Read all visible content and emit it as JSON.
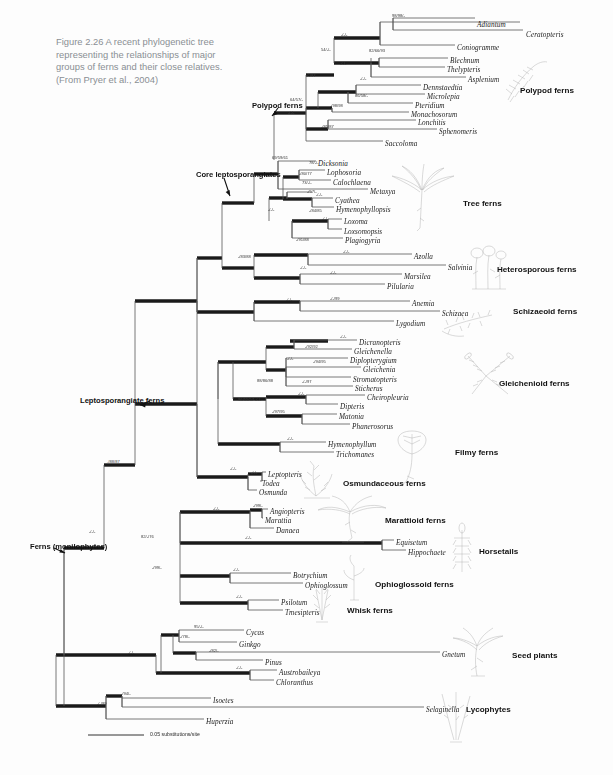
{
  "figure": {
    "caption": "Figure 2.26  A recent phylogenetic tree representing the relationships of major groups of ferns and their close relatives. (From Pryer et al., 2004)",
    "scale_bar_label": "0.05 substitutions/site"
  },
  "clade_labels": [
    {
      "text": "Polypod ferns",
      "x": 252,
      "y": 101
    },
    {
      "text": "Core leptosporangiates",
      "x": 196,
      "y": 170
    },
    {
      "text": "Leptosporangiate ferns",
      "x": 80,
      "y": 396
    },
    {
      "text": "Ferns (monilophytes)",
      "x": 30,
      "y": 542
    }
  ],
  "group_labels": [
    {
      "text": "Polypod ferns",
      "x": 520,
      "y": 86
    },
    {
      "text": "Tree ferns",
      "x": 463,
      "y": 199
    },
    {
      "text": "Heterosporous ferns",
      "x": 497,
      "y": 265
    },
    {
      "text": "Schizaeoid ferns",
      "x": 513,
      "y": 307
    },
    {
      "text": "Gleichenioid ferns",
      "x": 499,
      "y": 379
    },
    {
      "text": "Filmy ferns",
      "x": 455,
      "y": 448
    },
    {
      "text": "Osmundaceous ferns",
      "x": 343,
      "y": 479
    },
    {
      "text": "Marattioid ferns",
      "x": 385,
      "y": 516
    },
    {
      "text": "Horsetails",
      "x": 479,
      "y": 547
    },
    {
      "text": "Ophioglossoid ferns",
      "x": 375,
      "y": 580
    },
    {
      "text": "Whisk ferns",
      "x": 347,
      "y": 606
    },
    {
      "text": "Seed plants",
      "x": 512,
      "y": 651
    },
    {
      "text": "Lycophytes",
      "x": 466,
      "y": 705
    }
  ],
  "taxa": [
    {
      "name": "Adiantum",
      "x": 477,
      "y": 21,
      "italic": true
    },
    {
      "name": "Ceratopteris",
      "x": 526,
      "y": 31,
      "italic": true
    },
    {
      "name": "Coniogramme",
      "x": 457,
      "y": 44,
      "italic": true
    },
    {
      "name": "Blechnum",
      "x": 450,
      "y": 57,
      "italic": true
    },
    {
      "name": "Thelypteris",
      "x": 447,
      "y": 66,
      "italic": true
    },
    {
      "name": "Asplenium",
      "x": 468,
      "y": 76,
      "italic": true
    },
    {
      "name": "Dennstaedtia",
      "x": 423,
      "y": 84,
      "italic": true
    },
    {
      "name": "Microlepia",
      "x": 427,
      "y": 93,
      "italic": true
    },
    {
      "name": "Pteridium",
      "x": 415,
      "y": 102,
      "italic": true
    },
    {
      "name": "Monachosorum",
      "x": 411,
      "y": 111,
      "italic": true
    },
    {
      "name": "Lonchitis",
      "x": 418,
      "y": 119,
      "italic": true
    },
    {
      "name": "Sphenomeris",
      "x": 439,
      "y": 128,
      "italic": true
    },
    {
      "name": "Saccoloma",
      "x": 385,
      "y": 140,
      "italic": true
    },
    {
      "name": "Dicksonia",
      "x": 318,
      "y": 160,
      "italic": true
    },
    {
      "name": "Lophosoria",
      "x": 327,
      "y": 169,
      "italic": true
    },
    {
      "name": "Calochlaena",
      "x": 333,
      "y": 179,
      "italic": true
    },
    {
      "name": "Metaxya",
      "x": 370,
      "y": 188,
      "italic": true
    },
    {
      "name": "Cyathea",
      "x": 335,
      "y": 197,
      "italic": true
    },
    {
      "name": "Hymenophyllopsis",
      "x": 336,
      "y": 206,
      "italic": true
    },
    {
      "name": "Loxoma",
      "x": 344,
      "y": 218,
      "italic": true
    },
    {
      "name": "Loxsomopsis",
      "x": 344,
      "y": 228,
      "italic": true
    },
    {
      "name": "Plagiogyria",
      "x": 345,
      "y": 237,
      "italic": true
    },
    {
      "name": "Azolla",
      "x": 414,
      "y": 253,
      "italic": true
    },
    {
      "name": "Salvinia",
      "x": 448,
      "y": 264,
      "italic": true
    },
    {
      "name": "Marsilea",
      "x": 404,
      "y": 273,
      "italic": true
    },
    {
      "name": "Pilularia",
      "x": 387,
      "y": 283,
      "italic": true
    },
    {
      "name": "Anemia",
      "x": 412,
      "y": 300,
      "italic": true
    },
    {
      "name": "Schizaea",
      "x": 442,
      "y": 310,
      "italic": true
    },
    {
      "name": "Lygodium",
      "x": 396,
      "y": 320,
      "italic": true
    },
    {
      "name": "Dicranopteris",
      "x": 359,
      "y": 339,
      "italic": true
    },
    {
      "name": "Gleichenella",
      "x": 354,
      "y": 348,
      "italic": true
    },
    {
      "name": "Diplopterygium",
      "x": 350,
      "y": 357,
      "italic": true
    },
    {
      "name": "Gleichenia",
      "x": 363,
      "y": 366,
      "italic": true
    },
    {
      "name": "Stromatopteris",
      "x": 353,
      "y": 376,
      "italic": true
    },
    {
      "name": "Sticherus",
      "x": 355,
      "y": 385,
      "italic": true
    },
    {
      "name": "Cheiropleuria",
      "x": 367,
      "y": 394,
      "italic": true
    },
    {
      "name": "Dipteris",
      "x": 340,
      "y": 403,
      "italic": true
    },
    {
      "name": "Matonia",
      "x": 339,
      "y": 413,
      "italic": true
    },
    {
      "name": "Phanerosorus",
      "x": 352,
      "y": 423,
      "italic": true
    },
    {
      "name": "Hymenophyllum",
      "x": 328,
      "y": 441,
      "italic": true
    },
    {
      "name": "Trichomanes",
      "x": 336,
      "y": 451,
      "italic": true
    },
    {
      "name": "Leptopteris",
      "x": 268,
      "y": 471,
      "italic": true
    },
    {
      "name": "Todea",
      "x": 262,
      "y": 480,
      "italic": true
    },
    {
      "name": "Osmunda",
      "x": 259,
      "y": 489,
      "italic": true
    },
    {
      "name": "Angiopteris",
      "x": 270,
      "y": 508,
      "italic": true
    },
    {
      "name": "Marattia",
      "x": 265,
      "y": 517,
      "italic": true
    },
    {
      "name": "Danaea",
      "x": 276,
      "y": 527,
      "italic": true
    },
    {
      "name": "Equisetum",
      "x": 396,
      "y": 539,
      "italic": true
    },
    {
      "name": "Hippochaete",
      "x": 408,
      "y": 549,
      "italic": true
    },
    {
      "name": "Botrychium",
      "x": 293,
      "y": 572,
      "italic": true
    },
    {
      "name": "Ophioglossum",
      "x": 305,
      "y": 582,
      "italic": true
    },
    {
      "name": "Psilotum",
      "x": 281,
      "y": 599,
      "italic": true
    },
    {
      "name": "Tmesipteris",
      "x": 285,
      "y": 609,
      "italic": true
    },
    {
      "name": "Cycas",
      "x": 246,
      "y": 629,
      "italic": true
    },
    {
      "name": "Ginkgo",
      "x": 239,
      "y": 641,
      "italic": true
    },
    {
      "name": "Gnetum",
      "x": 442,
      "y": 651,
      "italic": true
    },
    {
      "name": "Pinus",
      "x": 265,
      "y": 659,
      "italic": true
    },
    {
      "name": "Austrobaileya",
      "x": 279,
      "y": 669,
      "italic": true
    },
    {
      "name": "Chloranthus",
      "x": 276,
      "y": 679,
      "italic": true
    },
    {
      "name": "Isoetes",
      "x": 213,
      "y": 697,
      "italic": true
    },
    {
      "name": "Selaginella",
      "x": 426,
      "y": 706,
      "italic": true
    },
    {
      "name": "Huperzia",
      "x": 206,
      "y": 718,
      "italic": true
    }
  ],
  "support_values": [
    {
      "text": "98/98/-",
      "x": 392,
      "y": 13
    },
    {
      "text": "-/-/-",
      "x": 341,
      "y": 32
    },
    {
      "text": "54/-/-",
      "x": 321,
      "y": 47
    },
    {
      "text": "82/66/93",
      "x": 369,
      "y": 48
    },
    {
      "text": "-/-/-",
      "x": 340,
      "y": 61
    },
    {
      "text": "-/-/97",
      "x": 306,
      "y": 73
    },
    {
      "text": "-/-/-",
      "x": 360,
      "y": 76
    },
    {
      "text": "86/58/-",
      "x": 355,
      "y": 93
    },
    {
      "text": "64/57/-",
      "x": 290,
      "y": 97
    },
    {
      "text": "-/98/98",
      "x": 330,
      "y": 103
    },
    {
      "text": "-/-/-",
      "x": 288,
      "y": 110
    },
    {
      "text": "-/85/87",
      "x": 321,
      "y": 124
    },
    {
      "text": "69/59/61",
      "x": 272,
      "y": 155
    },
    {
      "text": "78/-/-",
      "x": 309,
      "y": 160
    },
    {
      "text": "-/80/77",
      "x": 299,
      "y": 171
    },
    {
      "text": "73/-/-",
      "x": 302,
      "y": 180
    },
    {
      "text": "-/57/-",
      "x": 307,
      "y": 189
    },
    {
      "text": "-/-/-",
      "x": 316,
      "y": 192
    },
    {
      "text": "-/-/-",
      "x": 268,
      "y": 207
    },
    {
      "text": "-/84/85",
      "x": 309,
      "y": 208
    },
    {
      "text": "-/-/-",
      "x": 322,
      "y": 216
    },
    {
      "text": "-/91/88",
      "x": 296,
      "y": 237
    },
    {
      "text": "-/83/88",
      "x": 238,
      "y": 254
    },
    {
      "text": "-/-/-",
      "x": 343,
      "y": 249
    },
    {
      "text": "-/-/-",
      "x": 300,
      "y": 265
    },
    {
      "text": "-/-/-",
      "x": 330,
      "y": 270
    },
    {
      "text": "-/-/-",
      "x": 286,
      "y": 297
    },
    {
      "text": "-/-/99",
      "x": 330,
      "y": 296
    },
    {
      "text": "-/-/-",
      "x": 340,
      "y": 334
    },
    {
      "text": "-/92/92",
      "x": 305,
      "y": 344
    },
    {
      "text": "-/-/-",
      "x": 287,
      "y": 356
    },
    {
      "text": "-/94/95",
      "x": 313,
      "y": 359
    },
    {
      "text": "88/86/88",
      "x": 257,
      "y": 378
    },
    {
      "text": "-/-/97",
      "x": 302,
      "y": 379
    },
    {
      "text": "-/-/-",
      "x": 298,
      "y": 391
    },
    {
      "text": "-/97/95",
      "x": 272,
      "y": 409
    },
    {
      "text": "96/55/57",
      "x": 238,
      "y": 397
    },
    {
      "text": "-/-/-",
      "x": 255,
      "y": 397
    },
    {
      "text": "-/-/-",
      "x": 287,
      "y": 436
    },
    {
      "text": "-/-/-",
      "x": 251,
      "y": 470
    },
    {
      "text": "-/-/-",
      "x": 230,
      "y": 466
    },
    {
      "text": "-/88/87",
      "x": 107,
      "y": 459
    },
    {
      "text": "-/99/-",
      "x": 253,
      "y": 503
    },
    {
      "text": "-/-/-",
      "x": 213,
      "y": 506
    },
    {
      "text": "-/-/-",
      "x": 89,
      "y": 529
    },
    {
      "text": "82/-/76",
      "x": 141,
      "y": 534
    },
    {
      "text": "-/-/-",
      "x": 245,
      "y": 535
    },
    {
      "text": "-/99/-",
      "x": 152,
      "y": 565
    },
    {
      "text": "-/-/-",
      "x": 233,
      "y": 567
    },
    {
      "text": "-/-/-",
      "x": 236,
      "y": 594
    },
    {
      "text": "95/-/-",
      "x": 194,
      "y": 624
    },
    {
      "text": "-/78/-",
      "x": 180,
      "y": 634
    },
    {
      "text": "-/-/-",
      "x": 128,
      "y": 650
    },
    {
      "text": "-/82/-",
      "x": 209,
      "y": 648
    },
    {
      "text": "-/-/-",
      "x": 236,
      "y": 665
    },
    {
      "text": "-/94/-",
      "x": 121,
      "y": 691
    },
    {
      "text": "-/-/99",
      "x": 97,
      "y": 701
    }
  ],
  "colors": {
    "background": "#fdfdfd",
    "branch": "#1a1a1a",
    "thin_branch": "#6e6e6e",
    "caption_text": "#8a8f94",
    "sketch": "#7a7a7a"
  }
}
